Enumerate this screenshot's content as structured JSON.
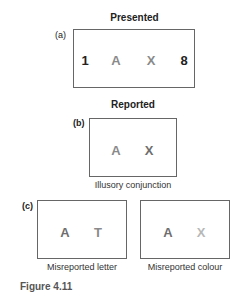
{
  "panel_a": {
    "heading": "Presented",
    "label": "(a)",
    "items": [
      {
        "char": "1",
        "color": "#222222"
      },
      {
        "char": "A",
        "color": "#8a8a8a"
      },
      {
        "char": "X",
        "color": "#8a8a8a"
      },
      {
        "char": "8",
        "color": "#222222"
      }
    ]
  },
  "panel_b": {
    "heading": "Reported",
    "label": "(b)",
    "items": [
      {
        "char": "A",
        "color": "#8a8a8a"
      },
      {
        "char": "X",
        "color": "#6e6e6e"
      }
    ],
    "caption": "Illusory conjunction"
  },
  "panel_c": {
    "label": "(c)",
    "left": {
      "items": [
        {
          "char": "A",
          "color": "#6e6e6e"
        },
        {
          "char": "T",
          "color": "#8a8a8a"
        }
      ],
      "caption": "Misreported letter"
    },
    "right": {
      "items": [
        {
          "char": "A",
          "color": "#6e6e6e"
        },
        {
          "char": "X",
          "color": "#b8b8b8"
        }
      ],
      "caption": "Misreported colour"
    }
  },
  "figure_caption": "Figure 4.11"
}
